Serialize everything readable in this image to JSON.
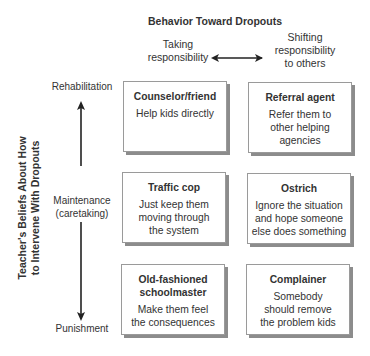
{
  "title": "Behavior Toward Dropouts",
  "y_axis_title": [
    "Teacher's Beliefs About How",
    "to Intervene With Dropouts"
  ],
  "columns": [
    {
      "label_lines": [
        "Taking",
        "responsibility"
      ]
    },
    {
      "label_lines": [
        "Shifting",
        "responsibility",
        "to others"
      ]
    }
  ],
  "rows": [
    {
      "label_lines": [
        "Rehabilitation"
      ]
    },
    {
      "label_lines": [
        "Maintenance",
        "(caretaking)"
      ]
    },
    {
      "label_lines": [
        "Punishment"
      ]
    }
  ],
  "boxes": [
    {
      "title_lines": [
        "Counselor/friend"
      ],
      "desc_lines": [
        "Help kids directly"
      ]
    },
    {
      "title_lines": [
        "Referral agent"
      ],
      "desc_lines": [
        "Refer them to",
        "other helping",
        "agencies"
      ]
    },
    {
      "title_lines": [
        "Traffic cop"
      ],
      "desc_lines": [
        "Just keep them",
        "moving through",
        "the system"
      ]
    },
    {
      "title_lines": [
        "Ostrich"
      ],
      "desc_lines": [
        "Ignore the situation",
        "and hope someone",
        "else does something"
      ]
    },
    {
      "title_lines": [
        "Old-fashioned",
        "schoolmaster"
      ],
      "desc_lines": [
        "Make them feel",
        "the consequences"
      ]
    },
    {
      "title_lines": [
        "Complainer"
      ],
      "desc_lines": [
        "Somebody",
        "should remove",
        "the problem kids"
      ]
    }
  ],
  "arrows": {
    "horizontal": {
      "type": "double-headed",
      "meaning": "Taking responsibility ↔ Shifting responsibility to others"
    },
    "vertical": {
      "type": "double-headed",
      "meaning": "Rehabilitation ↕ Punishment"
    }
  },
  "colors": {
    "text": "#333333",
    "border": "#9a9a9a",
    "shadow": "#8c8c8c",
    "arrow": "#222222"
  }
}
